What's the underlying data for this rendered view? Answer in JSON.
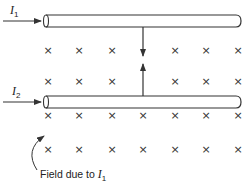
{
  "diagram": {
    "type": "physics-magnetic-field-parallel-wires",
    "wires": [
      {
        "id": "wire-1",
        "current_label": "I",
        "current_subscript": "1",
        "y": 21
      },
      {
        "id": "wire-2",
        "current_label": "I",
        "current_subscript": "2",
        "y": 102
      }
    ],
    "field_symbol": "×",
    "field_rows": [
      {
        "y": 54,
        "xs": [
          48,
          79,
          112,
          175,
          206,
          238
        ]
      },
      {
        "y": 85,
        "xs": [
          48,
          79,
          112,
          175,
          206,
          238
        ]
      },
      {
        "y": 119,
        "xs": [
          48,
          79,
          112,
          143,
          175,
          206,
          238
        ]
      },
      {
        "y": 153,
        "xs": [
          48,
          79,
          112,
          143,
          175,
          206,
          238
        ]
      }
    ],
    "force_arrows": {
      "x": 143,
      "description": "Forces between wires pointing toward each other (attraction)"
    },
    "caption": {
      "text": "Field due to ",
      "symbol": "I",
      "subscript": "1"
    },
    "colors": {
      "stroke": "#333333",
      "text": "#222222",
      "background": "#ffffff"
    }
  }
}
